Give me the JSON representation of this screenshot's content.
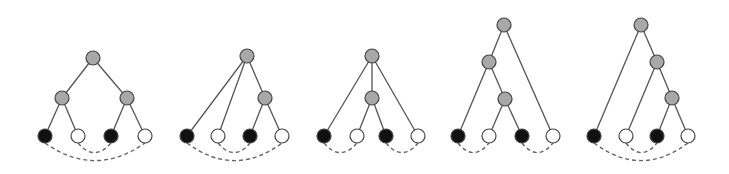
{
  "figure": {
    "colors": {
      "internal": "#a8a8a8",
      "leaf_black": "#111111",
      "leaf_white": "#ffffff",
      "edge": "#555555",
      "arc": "#666666"
    },
    "node_radius": 7,
    "trees": [
      {
        "id": "tree-1",
        "nodes": [
          {
            "id": "r",
            "type": "internal",
            "x": 93,
            "y": 58
          },
          {
            "id": "a",
            "type": "internal",
            "x": 62,
            "y": 98
          },
          {
            "id": "b",
            "type": "internal",
            "x": 127,
            "y": 98
          },
          {
            "id": "l1",
            "type": "leaf_black",
            "x": 45,
            "y": 136
          },
          {
            "id": "l2",
            "type": "leaf_white",
            "x": 78,
            "y": 136
          },
          {
            "id": "l3",
            "type": "leaf_black",
            "x": 111,
            "y": 136
          },
          {
            "id": "l4",
            "type": "leaf_white",
            "x": 145,
            "y": 136
          }
        ],
        "edges": [
          [
            "r",
            "a"
          ],
          [
            "r",
            "b"
          ],
          [
            "a",
            "l1"
          ],
          [
            "a",
            "l2"
          ],
          [
            "b",
            "l3"
          ],
          [
            "b",
            "l4"
          ]
        ],
        "arcs": [
          [
            "l1",
            "l4",
            22
          ],
          [
            "l2",
            "l3",
            12
          ]
        ]
      },
      {
        "id": "tree-2",
        "nodes": [
          {
            "id": "r",
            "type": "internal",
            "x": 247,
            "y": 56
          },
          {
            "id": "a",
            "type": "internal",
            "x": 265,
            "y": 98
          },
          {
            "id": "l1",
            "type": "leaf_black",
            "x": 187,
            "y": 136
          },
          {
            "id": "l2",
            "type": "leaf_white",
            "x": 218,
            "y": 136
          },
          {
            "id": "l3",
            "type": "leaf_black",
            "x": 250,
            "y": 136
          },
          {
            "id": "l4",
            "type": "leaf_white",
            "x": 282,
            "y": 136
          }
        ],
        "edges": [
          [
            "r",
            "l1"
          ],
          [
            "r",
            "l2"
          ],
          [
            "r",
            "a"
          ],
          [
            "a",
            "l3"
          ],
          [
            "a",
            "l4"
          ]
        ],
        "arcs": [
          [
            "l1",
            "l4",
            22
          ],
          [
            "l2",
            "l3",
            12
          ]
        ]
      },
      {
        "id": "tree-3",
        "nodes": [
          {
            "id": "r",
            "type": "internal",
            "x": 372,
            "y": 56
          },
          {
            "id": "a",
            "type": "internal",
            "x": 372,
            "y": 98
          },
          {
            "id": "l1",
            "type": "leaf_black",
            "x": 324,
            "y": 136
          },
          {
            "id": "l2",
            "type": "leaf_white",
            "x": 357,
            "y": 136
          },
          {
            "id": "l3",
            "type": "leaf_black",
            "x": 386,
            "y": 136
          },
          {
            "id": "l4",
            "type": "leaf_white",
            "x": 418,
            "y": 136
          }
        ],
        "edges": [
          [
            "r",
            "l1"
          ],
          [
            "r",
            "a"
          ],
          [
            "r",
            "l4"
          ],
          [
            "a",
            "l2"
          ],
          [
            "a",
            "l3"
          ]
        ],
        "arcs": [
          [
            "l1",
            "l2",
            12
          ],
          [
            "l3",
            "l4",
            12
          ]
        ]
      },
      {
        "id": "tree-4",
        "nodes": [
          {
            "id": "r",
            "type": "internal",
            "x": 504,
            "y": 25
          },
          {
            "id": "a",
            "type": "internal",
            "x": 489,
            "y": 62
          },
          {
            "id": "b",
            "type": "internal",
            "x": 505,
            "y": 99
          },
          {
            "id": "l1",
            "type": "leaf_black",
            "x": 458,
            "y": 136
          },
          {
            "id": "l2",
            "type": "leaf_white",
            "x": 489,
            "y": 136
          },
          {
            "id": "l3",
            "type": "leaf_black",
            "x": 522,
            "y": 136
          },
          {
            "id": "l4",
            "type": "leaf_white",
            "x": 553,
            "y": 136
          }
        ],
        "edges": [
          [
            "r",
            "a"
          ],
          [
            "r",
            "l4"
          ],
          [
            "a",
            "l1"
          ],
          [
            "a",
            "b"
          ],
          [
            "b",
            "l2"
          ],
          [
            "b",
            "l3"
          ]
        ],
        "arcs": [
          [
            "l1",
            "l2",
            12
          ],
          [
            "l3",
            "l4",
            12
          ]
        ]
      },
      {
        "id": "tree-5",
        "nodes": [
          {
            "id": "r",
            "type": "internal",
            "x": 641,
            "y": 25
          },
          {
            "id": "a",
            "type": "internal",
            "x": 657,
            "y": 62
          },
          {
            "id": "b",
            "type": "internal",
            "x": 672,
            "y": 98
          },
          {
            "id": "l1",
            "type": "leaf_black",
            "x": 594,
            "y": 136
          },
          {
            "id": "l2",
            "type": "leaf_white",
            "x": 626,
            "y": 136
          },
          {
            "id": "l3",
            "type": "leaf_black",
            "x": 657,
            "y": 136
          },
          {
            "id": "l4",
            "type": "leaf_white",
            "x": 688,
            "y": 136
          }
        ],
        "edges": [
          [
            "r",
            "l1"
          ],
          [
            "r",
            "a"
          ],
          [
            "a",
            "l2"
          ],
          [
            "a",
            "b"
          ],
          [
            "b",
            "l3"
          ],
          [
            "b",
            "l4"
          ]
        ],
        "arcs": [
          [
            "l1",
            "l4",
            22
          ],
          [
            "l2",
            "l3",
            12
          ]
        ]
      }
    ]
  }
}
